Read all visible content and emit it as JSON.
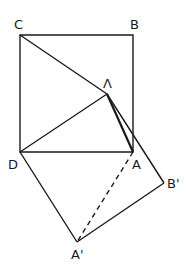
{
  "diagram": {
    "title": "",
    "labels": {
      "C": "C",
      "B": "B",
      "apex": "Λ",
      "D": "D",
      "A": "A",
      "B_prime": "B'",
      "A_prime": "A'"
    },
    "points": {
      "C": [
        20,
        35
      ],
      "B": [
        133,
        35
      ],
      "D": [
        20,
        152
      ],
      "A": [
        133,
        152
      ],
      "apex": [
        107,
        94
      ],
      "B_prime": [
        164,
        183
      ],
      "A_prime": [
        77,
        242
      ]
    },
    "colors": {
      "stroke": "#1a1a1a",
      "background": "#ffffff"
    }
  }
}
